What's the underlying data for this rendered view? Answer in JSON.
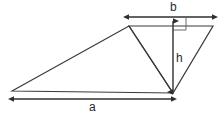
{
  "figure": {
    "kind": "geometry-diagram",
    "background_color": "#ffffff",
    "stroke_color": "#3a3a3a",
    "label_color": "#2b2b2b",
    "width": 221,
    "height": 117,
    "labels": {
      "base": "a",
      "top": "b",
      "height": "h"
    },
    "shapes": {
      "left_triangle": {
        "name": "large-oblique-triangle",
        "points": "12,91 129,26 173,93"
      },
      "right_triangle": {
        "name": "right-side-triangle",
        "points": "129,26 213,26 173,93"
      }
    },
    "dimensions": {
      "a": {
        "name": "base-dimension",
        "x1": 13,
        "y1": 99,
        "x2": 172,
        "y2": 99,
        "orientation": "horizontal",
        "label": "a"
      },
      "b": {
        "name": "top-dimension",
        "x1": 129,
        "y1": 17,
        "x2": 212,
        "y2": 17,
        "orientation": "horizontal",
        "label": "b"
      },
      "h": {
        "name": "height-dimension",
        "x1": 173,
        "y1": 21,
        "x2": 173,
        "y2": 92,
        "orientation": "vertical",
        "label": "h"
      }
    },
    "right_angle_marker": {
      "name": "right-angle-marker",
      "points": "173,30 186,30 186,18"
    }
  }
}
